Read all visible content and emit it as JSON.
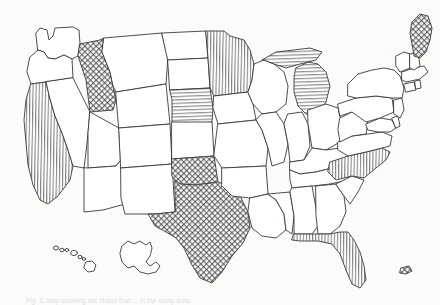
{
  "figure": {
    "caption": "Fig. 1.  Map showing the states that ... in the study area",
    "background_color": "#fbfbfa",
    "ink_color": "#3a3a38"
  },
  "legend_patterns": {
    "vertical": "vertical-hatch",
    "horizontal": "horizontal-hatch",
    "cross": "cross-hatch",
    "none": "unshaded"
  },
  "states": [
    {
      "id": "WA",
      "name": "Washington",
      "pattern": "none"
    },
    {
      "id": "OR",
      "name": "Oregon",
      "pattern": "none"
    },
    {
      "id": "CA",
      "name": "California",
      "pattern": "vertical"
    },
    {
      "id": "ID",
      "name": "Idaho",
      "pattern": "cross"
    },
    {
      "id": "NV",
      "name": "Nevada",
      "pattern": "none"
    },
    {
      "id": "MT",
      "name": "Montana",
      "pattern": "none"
    },
    {
      "id": "WY",
      "name": "Wyoming",
      "pattern": "none"
    },
    {
      "id": "UT",
      "name": "Utah",
      "pattern": "none"
    },
    {
      "id": "AZ",
      "name": "Arizona",
      "pattern": "none"
    },
    {
      "id": "CO",
      "name": "Colorado",
      "pattern": "none"
    },
    {
      "id": "NM",
      "name": "New Mexico",
      "pattern": "none"
    },
    {
      "id": "ND",
      "name": "North Dakota",
      "pattern": "none"
    },
    {
      "id": "SD",
      "name": "South Dakota",
      "pattern": "none"
    },
    {
      "id": "NE",
      "name": "Nebraska",
      "pattern": "horizontal"
    },
    {
      "id": "KS",
      "name": "Kansas",
      "pattern": "none"
    },
    {
      "id": "OK",
      "name": "Oklahoma",
      "pattern": "cross"
    },
    {
      "id": "TX",
      "name": "Texas",
      "pattern": "cross"
    },
    {
      "id": "MN",
      "name": "Minnesota",
      "pattern": "vertical"
    },
    {
      "id": "IA",
      "name": "Iowa",
      "pattern": "none"
    },
    {
      "id": "MO",
      "name": "Missouri",
      "pattern": "none"
    },
    {
      "id": "AR",
      "name": "Arkansas",
      "pattern": "none"
    },
    {
      "id": "LA",
      "name": "Louisiana",
      "pattern": "none"
    },
    {
      "id": "WI",
      "name": "Wisconsin",
      "pattern": "none"
    },
    {
      "id": "IL",
      "name": "Illinois",
      "pattern": "none"
    },
    {
      "id": "MS",
      "name": "Mississippi",
      "pattern": "none"
    },
    {
      "id": "MI-UP",
      "name": "Michigan Upper Peninsula",
      "pattern": "horizontal"
    },
    {
      "id": "MI",
      "name": "Michigan",
      "pattern": "horizontal"
    },
    {
      "id": "IN",
      "name": "Indiana",
      "pattern": "none"
    },
    {
      "id": "OH",
      "name": "Ohio",
      "pattern": "none"
    },
    {
      "id": "KY",
      "name": "Kentucky",
      "pattern": "none"
    },
    {
      "id": "TN",
      "name": "Tennessee",
      "pattern": "none"
    },
    {
      "id": "AL",
      "name": "Alabama",
      "pattern": "none"
    },
    {
      "id": "GA",
      "name": "Georgia",
      "pattern": "none"
    },
    {
      "id": "FL",
      "name": "Florida",
      "pattern": "vertical"
    },
    {
      "id": "SC",
      "name": "South Carolina",
      "pattern": "none"
    },
    {
      "id": "NC",
      "name": "North Carolina",
      "pattern": "vertical"
    },
    {
      "id": "VA",
      "name": "Virginia",
      "pattern": "none"
    },
    {
      "id": "WV",
      "name": "West Virginia",
      "pattern": "none"
    },
    {
      "id": "MD",
      "name": "Maryland",
      "pattern": "none"
    },
    {
      "id": "DE",
      "name": "Delaware",
      "pattern": "none"
    },
    {
      "id": "PA",
      "name": "Pennsylvania",
      "pattern": "none"
    },
    {
      "id": "NJ",
      "name": "New Jersey",
      "pattern": "none"
    },
    {
      "id": "NY",
      "name": "New York",
      "pattern": "none"
    },
    {
      "id": "CT",
      "name": "Connecticut",
      "pattern": "none"
    },
    {
      "id": "RI",
      "name": "Rhode Island",
      "pattern": "none"
    },
    {
      "id": "MA",
      "name": "Massachusetts",
      "pattern": "none"
    },
    {
      "id": "VT",
      "name": "Vermont",
      "pattern": "none"
    },
    {
      "id": "NH",
      "name": "New Hampshire",
      "pattern": "none"
    },
    {
      "id": "ME",
      "name": "Maine",
      "pattern": "cross"
    }
  ],
  "insets": [
    {
      "id": "HI",
      "name": "Hawaii",
      "pattern": "none"
    },
    {
      "id": "AK",
      "name": "Alaska",
      "pattern": "none"
    },
    {
      "id": "PR",
      "name": "Puerto Rico",
      "pattern": "cross"
    }
  ],
  "shaded_states": [
    "California",
    "Idaho",
    "Nebraska",
    "Oklahoma",
    "Texas",
    "Minnesota",
    "Michigan",
    "North Carolina",
    "Florida",
    "Maine"
  ],
  "counts": {
    "total_states_drawn": 49,
    "shaded_states": 10,
    "insets": 3
  }
}
